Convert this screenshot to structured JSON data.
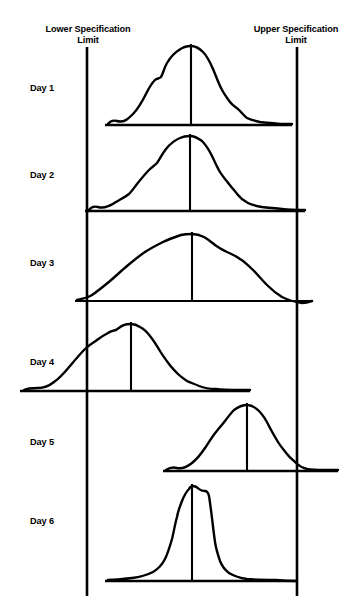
{
  "figure": {
    "width": 364,
    "height": 607,
    "background": "#ffffff",
    "ink_color": "#000000"
  },
  "spec_limits": {
    "lower": {
      "label": "Lower Specification\nLimit",
      "line1": "Lower Specification",
      "line2": "Limit",
      "x": 87,
      "y_top": 47,
      "y_bottom": 596
    },
    "upper": {
      "label": "Upper Specification\nLimit",
      "line1": "Upper Specification",
      "line2": "Limit",
      "x": 297,
      "y_top": 47,
      "y_bottom": 596
    }
  },
  "days": [
    {
      "label": "Day 1",
      "label_x": 30,
      "label_y": 83,
      "baseline_y": 125,
      "baseline_x0": 105,
      "baseline_x1": 292,
      "center_x": 191,
      "peak_y": 46,
      "spread": "moderate",
      "position": "centered",
      "within_limits": true,
      "path": "M 108 124 C 110 121 113 120 117 121 C 124 123 128 119 133 114 C 139 108 143 100 147 92 C 150 86 152 83 155 80 C 157 78 159 79 161 77 C 163 74 164 68 167 63 C 170 58 174 53 179 50 C 183 47 187 46 191 46 C 195 46 199 48 203 52 C 207 56 210 62 213 69 C 216 76 218 82 221 88 C 224 94 227 98 230 102 C 233 106 236 107 239 110 C 242 113 244 116 247 118 C 251 120 255 121 260 122 C 266 123 273 123 280 124 C 285 124 289 124 292 124"
    },
    {
      "label": "Day 2",
      "label_x": 30,
      "label_y": 170,
      "baseline_y": 211,
      "baseline_x0": 85,
      "baseline_x1": 305,
      "center_x": 190,
      "peak_y": 136,
      "spread": "wide",
      "position": "centered",
      "within_limits": true,
      "path": "M 89 210 C 91 207 94 206 98 207 C 104 209 110 206 116 202 C 121 199 125 197 129 194 C 132 191 134 188 137 184 C 141 179 145 174 149 170 C 152 167 154 166 157 163 C 160 159 162 154 166 149 C 170 144 175 140 180 138 C 184 136 187 136 190 136 C 194 136 198 138 202 141 C 206 145 209 150 212 156 C 215 162 217 167 220 172 C 223 177 226 180 229 184 C 232 188 235 191 238 195 C 241 199 244 201 248 203 C 252 205 257 206 262 207 C 268 208 275 208 282 209 C 290 210 298 210 305 210"
    },
    {
      "label": "Day 3",
      "label_x": 30,
      "label_y": 258,
      "baseline_y": 301,
      "baseline_x0": 75,
      "baseline_x1": 312,
      "center_x": 192,
      "peak_y": 234,
      "spread": "very wide",
      "position": "centered",
      "within_limits": false,
      "exceeds": "both",
      "path": "M 77 300 C 82 299 87 298 92 295 C 98 291 104 286 110 281 C 116 276 121 271 127 266 C 133 261 139 256 145 252 C 151 248 157 245 163 242 C 169 239 175 237 181 235 C 185 234 189 234 192 234 C 196 234 200 235 204 237 C 208 239 211 242 215 245 C 219 248 223 250 227 252 C 232 254 236 256 240 259 C 245 262 249 266 253 270 C 258 275 262 280 267 285 C 272 290 277 294 282 297 C 288 300 295 302 302 303 C 306 303 309 302 312 301"
    },
    {
      "label": "Day 4",
      "label_x": 30,
      "label_y": 357,
      "baseline_y": 391,
      "baseline_x0": 20,
      "baseline_x1": 250,
      "center_x": 131,
      "peak_y": 324,
      "spread": "moderate",
      "position": "shifted left",
      "within_limits": false,
      "exceeds": "lower",
      "path": "M 24 390 C 28 388 33 388 38 388 C 44 388 49 386 54 382 C 60 378 65 372 70 366 C 75 360 80 354 85 349 C 89 345 93 343 97 340 C 101 337 104 335 108 333 C 111 331 113 331 116 330 C 119 328 121 326 124 325 C 126 324 129 324 131 324 C 134 324 137 325 140 327 C 144 329 147 332 150 336 C 154 341 157 346 160 351 C 163 356 166 360 169 364 C 172 368 175 371 178 374 C 181 377 184 379 187 381 C 191 383 195 384 199 386 C 204 388 210 389 216 389 C 223 390 231 390 240 390 C 245 390 248 390 250 390"
    },
    {
      "label": "Day 5",
      "label_x": 30,
      "label_y": 437,
      "baseline_y": 471,
      "baseline_x0": 163,
      "baseline_x1": 338,
      "center_x": 247,
      "peak_y": 405,
      "spread": "moderate",
      "position": "shifted right",
      "within_limits": false,
      "exceeds": "upper",
      "path": "M 166 470 C 169 468 173 467 177 468 C 182 469 187 467 192 463 C 197 459 201 454 205 448 C 209 442 212 437 216 432 C 219 428 222 425 225 421 C 228 417 231 413 234 410 C 238 407 242 405 247 405 C 251 405 255 407 259 411 C 263 415 266 420 269 426 C 272 432 275 437 278 442 C 281 447 284 450 287 454 C 290 458 293 460 296 463 C 299 466 303 468 307 469 C 312 470 318 470 325 470 C 331 470 335 470 338 470"
    },
    {
      "label": "Day 6",
      "label_x": 30,
      "label_y": 516,
      "baseline_y": 581,
      "baseline_x0": 105,
      "baseline_x1": 297,
      "center_x": 192,
      "peak_y": 486,
      "spread": "narrow",
      "position": "centered",
      "within_limits": true,
      "path": "M 108 580 C 116 580 124 579 132 578 C 140 577 147 575 153 572 C 158 569 162 565 165 559 C 168 553 170 546 172 539 C 174 531 175 524 177 517 C 178 511 180 506 182 501 C 184 496 186 492 189 489 C 190 487 191 486 193 486 C 195 486 197 487 199 489 C 201 491 203 491 205 491 C 207 491 208 492 209 496 C 210 502 211 510 212 518 C 213 527 214 535 215 542 C 216 549 218 555 220 561 C 222 566 225 570 229 573 C 234 576 240 578 247 579 C 256 580 266 580 276 580 C 285 581 292 581 297 581"
    }
  ]
}
